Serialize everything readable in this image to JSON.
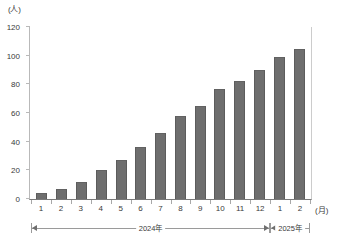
{
  "chart_data": {
    "type": "bar",
    "title": "",
    "xlabel": "(月)",
    "ylabel": "(人)",
    "ylim": [
      0,
      120
    ],
    "yticks": [
      0,
      20,
      40,
      60,
      80,
      100,
      120
    ],
    "grid": false,
    "legend": null,
    "categories": [
      "1",
      "2",
      "3",
      "4",
      "5",
      "6",
      "7",
      "8",
      "9",
      "10",
      "11",
      "12",
      "1",
      "2"
    ],
    "values": [
      4,
      7,
      12,
      20,
      27,
      36,
      46,
      58,
      65,
      77,
      82,
      90,
      99,
      105
    ],
    "series": [
      {
        "name": "人数",
        "values": [
          4,
          7,
          12,
          20,
          27,
          36,
          46,
          58,
          65,
          77,
          82,
          90,
          99,
          105
        ]
      }
    ],
    "annotations": [
      {
        "label": "2024年",
        "start_category_index": 0,
        "end_category_index": 11
      },
      {
        "label": "2025年",
        "start_category_index": 12,
        "end_category_index": 13
      }
    ],
    "colors": {
      "bar": "#6e6e6e",
      "bar_edge": "#5c5c5c",
      "axis": "#7a7a7a",
      "text": "#3a3a3a"
    }
  }
}
